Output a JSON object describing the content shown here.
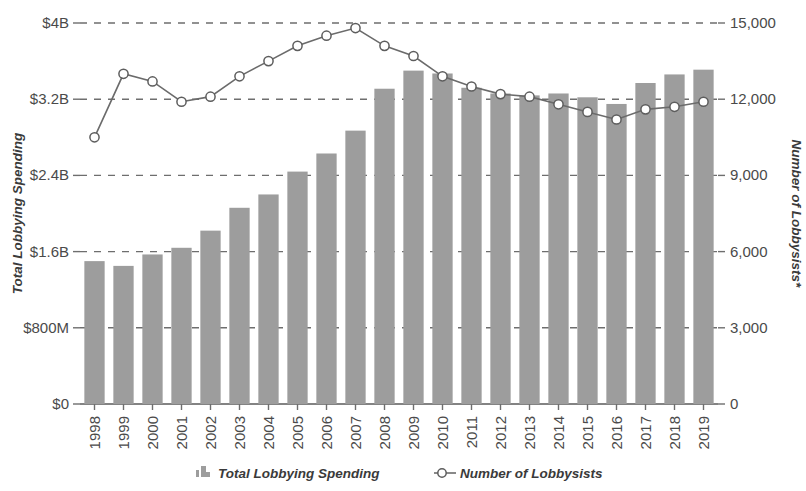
{
  "chart_data": {
    "type": "bar",
    "title": "",
    "subtitle": "",
    "xlabel": "",
    "ylabel": "Total Lobbying Spending",
    "y2label": "Number of Lobbysists*",
    "categories": [
      "1998",
      "1999",
      "2000",
      "2001",
      "2002",
      "2003",
      "2004",
      "2005",
      "2006",
      "2007",
      "2008",
      "2009",
      "2010",
      "2011",
      "2012",
      "2013",
      "2014",
      "2015",
      "2016",
      "2017",
      "2018",
      "2019"
    ],
    "grid": true,
    "legend_position": "bottom",
    "ylim": [
      0,
      4000000000
    ],
    "y2lim": [
      0,
      15000
    ],
    "ytick_labels": [
      "$0",
      "$800M",
      "$1.6B",
      "$2.4B",
      "$3.2B",
      "$4B"
    ],
    "ytick_values": [
      0,
      800000000,
      1600000000,
      2400000000,
      3200000000,
      4000000000
    ],
    "y2tick_labels": [
      "0",
      "3,000",
      "6,000",
      "9,000",
      "12,000",
      "15,000"
    ],
    "y2tick_values": [
      0,
      3000,
      6000,
      9000,
      12000,
      15000
    ],
    "series": [
      {
        "name": "Total Lobbying Spending",
        "type": "bar",
        "axis": "left",
        "color": "#9d9d9d",
        "values": [
          1500000000,
          1450000000,
          1570000000,
          1640000000,
          1820000000,
          2060000000,
          2200000000,
          2440000000,
          2630000000,
          2870000000,
          3310000000,
          3500000000,
          3470000000,
          3320000000,
          3260000000,
          3240000000,
          3260000000,
          3220000000,
          3150000000,
          3370000000,
          3460000000,
          3510000000
        ]
      },
      {
        "name": "Number of Lobbysists",
        "type": "line",
        "axis": "right",
        "color": "#6b6b6b",
        "marker": "open-circle",
        "values": [
          10500,
          13000,
          12700,
          11900,
          12100,
          12900,
          13500,
          14100,
          14500,
          14800,
          14100,
          13700,
          12900,
          12500,
          12200,
          12100,
          11800,
          11500,
          11200,
          11600,
          11700,
          11900
        ]
      }
    ]
  },
  "legend": {
    "items": [
      {
        "label": "Total Lobbying Spending",
        "icon": "bar-swatch-icon"
      },
      {
        "label": "Number of Lobbysists",
        "icon": "open-circle-marker-icon"
      }
    ]
  },
  "colors": {
    "bar": "#9d9d9d",
    "line": "#6b6b6b",
    "grid": "#6e6e6e",
    "text": "#3a3a3a",
    "background": "#ffffff"
  }
}
